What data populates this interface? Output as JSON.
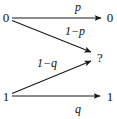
{
  "diagram": {
    "stroke_color": "#1a1a1a",
    "text_color": "#111111",
    "background_color": "#ffffff",
    "nodes": {
      "input_top": "0",
      "input_bottom": "1",
      "output_top": "0",
      "output_erasure": "?",
      "output_bottom": "1"
    },
    "edges": [
      {
        "name": "zero-to-zero",
        "from": "0",
        "to": "0",
        "label": "p",
        "label_prefix": "",
        "label_operator": "",
        "label_symbol": "p"
      },
      {
        "name": "zero-to-erasure",
        "from": "0",
        "to": "?",
        "label": "1−p",
        "label_prefix": "1",
        "label_operator": "−",
        "label_symbol": "p"
      },
      {
        "name": "one-to-erasure",
        "from": "1",
        "to": "?",
        "label": "1−q",
        "label_prefix": "1",
        "label_operator": "−",
        "label_symbol": "q"
      },
      {
        "name": "one-to-one",
        "from": "1",
        "to": "1",
        "label": "q",
        "label_prefix": "",
        "label_operator": "",
        "label_symbol": "q"
      }
    ]
  }
}
